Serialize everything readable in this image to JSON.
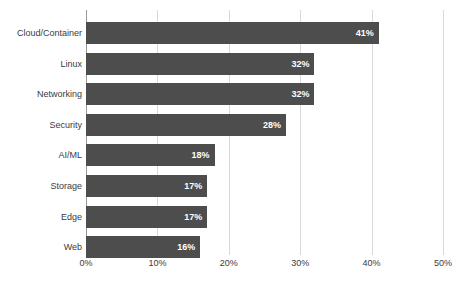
{
  "chart_data": {
    "type": "bar",
    "orientation": "horizontal",
    "title": "",
    "subtitle": "",
    "xlabel": "",
    "ylabel": "",
    "categories": [
      "Cloud/Container",
      "Linux",
      "Networking",
      "Security",
      "AI/ML",
      "Storage",
      "Edge",
      "Web"
    ],
    "values": [
      41,
      32,
      32,
      28,
      18,
      17,
      17,
      16
    ],
    "value_labels": [
      "41%",
      "32%",
      "32%",
      "28%",
      "18%",
      "17%",
      "17%",
      "16%"
    ],
    "xlim": [
      0,
      50
    ],
    "xticks": [
      0,
      10,
      20,
      30,
      40,
      50
    ],
    "xtick_labels": [
      "0%",
      "10%",
      "20%",
      "30%",
      "40%",
      "50%"
    ],
    "grid": "vertical",
    "legend": "none",
    "bar_color": "#4d4d4d",
    "gridline_color": "#d9d9d9",
    "axis_color": "#9a9a9a",
    "value_label_color": "#ffffff",
    "background_color": "#ffffff"
  }
}
